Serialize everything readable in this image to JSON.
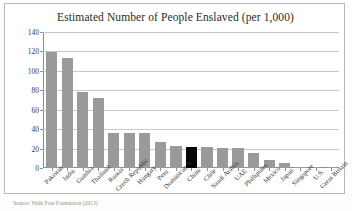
{
  "figure": {
    "title": "Estimated Number of People Enslaved (per 1,000)",
    "source_note": "Source: Walk Free Foundation (2013)",
    "source_note_right": "",
    "highlight_color": "#050505",
    "bar_color": "#9a9a9a",
    "grid_color": "#c8c8c8"
  },
  "chart_data": {
    "type": "bar",
    "title": "Estimated Number of People Enslaved (per 1,000)",
    "xlabel": "",
    "ylabel": "",
    "ylim": [
      0,
      140
    ],
    "yticks": [
      0,
      20,
      40,
      60,
      80,
      100,
      120,
      140
    ],
    "grid": true,
    "legend": false,
    "highlighted_category": "China",
    "categories": [
      "Pakistan",
      "India",
      "Gambia",
      "Thailand",
      "Russia",
      "Czech Republic",
      "Hungary",
      "Peru",
      "Dominican R",
      "China",
      "Chile",
      "Saudi Arabia",
      "UAE",
      "Phillipines",
      "Mexico",
      "Japan",
      "Singapore",
      "U.S.",
      "Great Britain"
    ],
    "values": [
      119,
      113.5,
      78,
      72,
      36,
      36,
      36,
      27,
      23,
      22,
      21.5,
      20.5,
      20.5,
      15,
      8,
      5,
      1.5,
      1.2,
      0.8
    ]
  }
}
